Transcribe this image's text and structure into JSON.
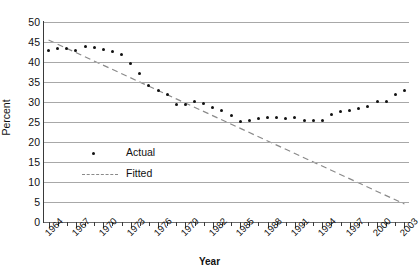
{
  "chart_data": {
    "type": "scatter",
    "title": "",
    "xlabel": "Year",
    "ylabel": "Percent",
    "xlim": [
      1963.5,
      2003.5
    ],
    "ylim": [
      0,
      50
    ],
    "grid": true,
    "legend_position": "inside-left",
    "y_ticks": [
      50,
      45,
      40,
      35,
      30,
      25,
      20,
      15,
      10,
      5,
      0
    ],
    "x_ticks": [
      1964,
      1967,
      1970,
      1973,
      1976,
      1979,
      1982,
      1985,
      1988,
      1991,
      1994,
      1997,
      2000,
      2003
    ],
    "x_tick_all_years": [
      1964,
      1965,
      1966,
      1967,
      1968,
      1969,
      1970,
      1971,
      1972,
      1973,
      1974,
      1975,
      1976,
      1977,
      1978,
      1979,
      1980,
      1981,
      1982,
      1983,
      1984,
      1985,
      1986,
      1987,
      1988,
      1989,
      1990,
      1991,
      1992,
      1993,
      1994,
      1995,
      1996,
      1997,
      1998,
      1999,
      2000,
      2001,
      2002,
      2003
    ],
    "series": [
      {
        "name": "Actual",
        "style": "points",
        "color": "#111111",
        "x": [
          1964,
          1965,
          1966,
          1967,
          1968,
          1969,
          1970,
          1971,
          1972,
          1973,
          1974,
          1975,
          1976,
          1977,
          1978,
          1979,
          1980,
          1981,
          1982,
          1983,
          1984,
          1985,
          1986,
          1987,
          1988,
          1989,
          1990,
          1991,
          1992,
          1993,
          1994,
          1995,
          1996,
          1997,
          1998,
          1999,
          2000,
          2001,
          2002,
          2003
        ],
        "values": [
          43.0,
          43.4,
          43.4,
          42.8,
          43.8,
          43.6,
          43.2,
          42.6,
          41.8,
          39.7,
          37.2,
          34.2,
          33.0,
          31.8,
          29.4,
          29.4,
          30.2,
          29.6,
          28.6,
          28.0,
          26.6,
          25.2,
          25.4,
          26.0,
          26.2,
          26.1,
          25.8,
          26.1,
          25.3,
          25.4,
          25.5,
          27.0,
          27.6,
          28.0,
          28.4,
          29.0,
          30.2,
          30.2,
          32.0,
          33.0
        ]
      },
      {
        "name": "Fitted",
        "style": "dashed-line",
        "color": "#8a8a8a",
        "x": [
          1964,
          2003
        ],
        "values": [
          45.5,
          4.5
        ]
      }
    ],
    "legend": [
      {
        "label": "Actual",
        "marker": "dot"
      },
      {
        "label": "Fitted",
        "marker": "dashed"
      }
    ]
  }
}
